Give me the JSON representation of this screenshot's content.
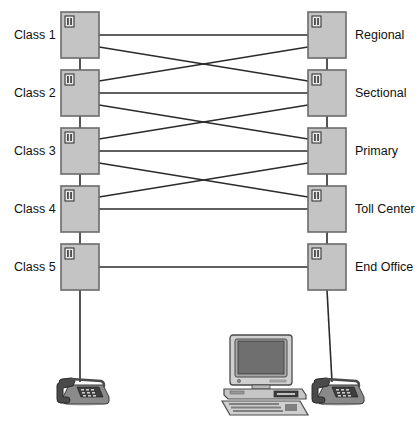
{
  "diagram": {
    "colors": {
      "box_fill": "#c4c4c4",
      "box_stroke": "#6b6b6b",
      "line": "#2b2b2b",
      "text": "#111111",
      "device_body": "#8a8a8a",
      "device_dark": "#4a4a4a",
      "device_light": "#d4d4d4",
      "screen": "#6f6f6f",
      "background": "#ffffff"
    },
    "icon_name": "switch-icon",
    "left_labels": [
      {
        "id": "class-1",
        "text": "Class 1"
      },
      {
        "id": "class-2",
        "text": "Class 2"
      },
      {
        "id": "class-3",
        "text": "Class 3"
      },
      {
        "id": "class-4",
        "text": "Class 4"
      },
      {
        "id": "class-5",
        "text": "Class 5"
      }
    ],
    "right_labels": [
      {
        "id": "regional",
        "text": "Regional"
      },
      {
        "id": "sectional",
        "text": "Sectional"
      },
      {
        "id": "primary",
        "text": "Primary"
      },
      {
        "id": "toll-center",
        "text": "Toll Center"
      },
      {
        "id": "end-office",
        "text": "End Office"
      }
    ],
    "nodes": {
      "left_column_x": 61,
      "right_column_x": 308,
      "box_width": 38,
      "box_height": 46,
      "row_tops": [
        12,
        70,
        128,
        186,
        244
      ]
    },
    "devices": [
      {
        "id": "telephone-left",
        "name": "telephone-icon",
        "x": 55,
        "y": 375
      },
      {
        "id": "computer",
        "name": "desktop-computer-icon",
        "x": 222,
        "y": 335
      },
      {
        "id": "telephone-right",
        "name": "telephone-icon",
        "x": 310,
        "y": 375
      }
    ],
    "links": {
      "horizontal_count": 5,
      "diagonal_pairs": 4,
      "vertical_trunks": 8
    }
  }
}
